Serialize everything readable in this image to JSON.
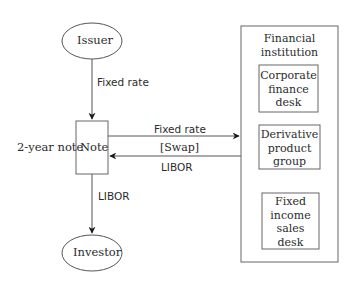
{
  "diagram": {
    "nodes": {
      "issuer": {
        "label": "Issuer",
        "shape": "ellipse"
      },
      "note": {
        "label": "Note",
        "shape": "rectangle",
        "side_label": "2-year note"
      },
      "investor": {
        "label": "Investor",
        "shape": "ellipse"
      },
      "financial_institution": {
        "label_line1": "Financial",
        "label_line2": "institution",
        "shape": "rectangle",
        "children": [
          {
            "lines": [
              "Corporate",
              "finance",
              "desk"
            ]
          },
          {
            "lines": [
              "Derivative",
              "product",
              "group"
            ]
          },
          {
            "lines": [
              "Fixed",
              "income",
              "sales",
              "desk"
            ]
          }
        ]
      }
    },
    "edges": {
      "issuer_to_note": {
        "label": "Fixed rate"
      },
      "note_to_fi": {
        "label": "Fixed rate"
      },
      "swap": {
        "label": "[Swap]"
      },
      "fi_to_note": {
        "label": "LIBOR"
      },
      "note_to_investor": {
        "label": "LIBOR"
      }
    },
    "colors": {
      "stroke": "#555555",
      "text": "#2b2b2b",
      "background": "#ffffff"
    }
  }
}
